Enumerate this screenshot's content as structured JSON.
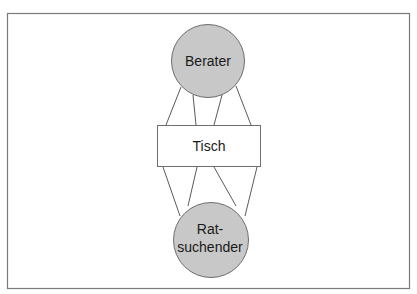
{
  "diagram": {
    "nodes": [
      {
        "id": "berater",
        "shape": "circle",
        "label_lines": [
          "Berater"
        ],
        "fill": "#c8c8c8",
        "stroke": "#6e6e6e"
      },
      {
        "id": "tisch",
        "shape": "rect",
        "label_lines": [
          "Tisch"
        ],
        "fill": "#ffffff",
        "stroke": "#6e6e6e"
      },
      {
        "id": "ratsuchender",
        "shape": "circle",
        "label_lines": [
          "Rat-",
          "suchender"
        ],
        "fill": "#c8c8c8",
        "stroke": "#6e6e6e"
      }
    ],
    "edges": [
      {
        "from": "berater",
        "to": "tisch",
        "count": 4
      },
      {
        "from": "tisch",
        "to": "ratsuchender",
        "count": 4
      }
    ],
    "frame_color": "#7a7a7a",
    "line_color": "#5a5a5a"
  }
}
